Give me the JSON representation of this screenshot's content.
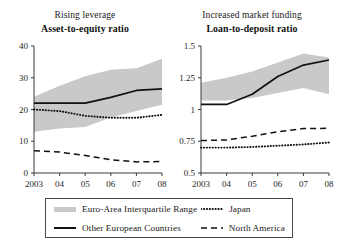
{
  "figure": {
    "panels": [
      {
        "id": "asset-to-equity",
        "supertitle": "Rising leverage",
        "title": "Asset-to-equity ratio"
      },
      {
        "id": "loan-to-deposit",
        "supertitle": "Increased market funding",
        "title": "Loan-to-deposit ratio"
      }
    ]
  },
  "legend": {
    "items": [
      {
        "key": "euro-area-band",
        "label": "Euro-Area Interquartile Range",
        "style": "band",
        "color": "#c9c9c9"
      },
      {
        "key": "japan",
        "label": "Japan",
        "style": "dotted",
        "color": "#111111"
      },
      {
        "key": "other-europe",
        "label": "Other European Countries",
        "style": "solid",
        "color": "#111111"
      },
      {
        "key": "north-america",
        "label": "North America",
        "style": "dashed",
        "color": "#111111"
      }
    ]
  },
  "chart_data": [
    {
      "type": "line",
      "id": "asset-to-equity",
      "title": "Asset-to-equity ratio",
      "subtitle": "Rising leverage",
      "xlabel": "",
      "ylabel": "",
      "x": [
        2003,
        2004,
        2005,
        2006,
        2007,
        2008
      ],
      "xticklabels": [
        "2003",
        "04",
        "05",
        "06",
        "07",
        "08"
      ],
      "xlim": [
        2003,
        2008
      ],
      "ylim": [
        0,
        40
      ],
      "yticks": [
        0,
        10,
        20,
        30,
        40
      ],
      "yticklabels": [
        "0",
        "10",
        "20",
        "30",
        "40"
      ],
      "grid": false,
      "legend_position": "below-figure",
      "band": {
        "name": "Euro-Area Interquartile Range",
        "upper": [
          24.0,
          27.5,
          30.5,
          32.5,
          33.0,
          36.0
        ],
        "lower": [
          13.0,
          14.0,
          14.5,
          17.5,
          19.5,
          21.5
        ]
      },
      "series": [
        {
          "name": "Other European Countries",
          "style": "solid",
          "values": [
            22.0,
            22.0,
            22.0,
            23.8,
            26.0,
            26.5
          ]
        },
        {
          "name": "Japan",
          "style": "dotted",
          "values": [
            20.0,
            19.5,
            18.0,
            17.4,
            17.4,
            18.3
          ]
        },
        {
          "name": "North America",
          "style": "dashed",
          "values": [
            7.0,
            6.6,
            5.5,
            4.2,
            3.5,
            3.6
          ]
        }
      ]
    },
    {
      "type": "line",
      "id": "loan-to-deposit",
      "title": "Loan-to-deposit ratio",
      "subtitle": "Increased market funding",
      "xlabel": "",
      "ylabel": "",
      "x": [
        2003,
        2004,
        2005,
        2006,
        2007,
        2008
      ],
      "xticklabels": [
        "2003",
        "04",
        "05",
        "06",
        "07",
        "08"
      ],
      "xlim": [
        2003,
        2008
      ],
      "ylim": [
        0.5,
        1.5
      ],
      "yticks": [
        0.5,
        0.75,
        1.0,
        1.25,
        1.5
      ],
      "yticklabels": [
        "0.5",
        "0.75",
        "1",
        "1.25",
        "1.5"
      ],
      "grid": false,
      "legend_position": "below-figure",
      "band": {
        "name": "Euro-Area Interquartile Range",
        "upper": [
          1.21,
          1.25,
          1.3,
          1.37,
          1.44,
          1.41
        ],
        "lower": [
          1.07,
          1.07,
          1.09,
          1.13,
          1.17,
          1.12
        ]
      },
      "series": [
        {
          "name": "Other European Countries",
          "style": "solid",
          "values": [
            1.04,
            1.04,
            1.12,
            1.26,
            1.35,
            1.39
          ]
        },
        {
          "name": "North America",
          "style": "dashed",
          "values": [
            0.755,
            0.76,
            0.79,
            0.825,
            0.85,
            0.852
          ]
        },
        {
          "name": "Japan",
          "style": "dotted",
          "values": [
            0.7,
            0.7,
            0.705,
            0.715,
            0.725,
            0.74
          ]
        }
      ]
    }
  ]
}
